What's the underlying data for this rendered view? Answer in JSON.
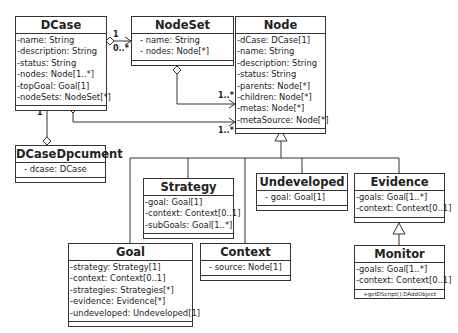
{
  "diagram_type": "UML class diagram",
  "classes": {
    "dcase": {
      "name": "DCase",
      "attributes": [
        "-name: String",
        "-description: String",
        "-status: String",
        "-nodes: Node[1..*]",
        "-topGoal: Goal[1]",
        "-nodeSets: NodeSet[*]"
      ]
    },
    "nodeset": {
      "name": "NodeSet",
      "attributes": [
        "-  name: String",
        "-  nodes: Node[*]"
      ]
    },
    "node": {
      "name": "Node",
      "attributes": [
        "-dCase: DCase[1]",
        "-name: String",
        "-description: String",
        "-status: String",
        "-parents: Node[*]",
        "-children: Node[*]",
        "-metas: Node[*]",
        "-metaSource: Node[*]"
      ]
    },
    "dcasedocument": {
      "name": "DCaseDpcument",
      "attributes": [
        "-  dcase: DCase"
      ]
    },
    "strategy": {
      "name": "Strategy",
      "attributes": [
        "-goal: Goal[1]",
        "-context: Context[0..1]",
        "-subGoals: Goal[1..*]"
      ]
    },
    "undeveloped": {
      "name": "Undeveloped",
      "attributes": [
        "-  goal: Goal[1]"
      ]
    },
    "evidence": {
      "name": "Evidence",
      "attributes": [
        "-goals: Goal[1..*]",
        "-context: Context[0..1]"
      ]
    },
    "goal": {
      "name": "Goal",
      "attributes": [
        "-strategy: Strategy[1]",
        "-context: Context[0..1]",
        "-strategies: Strategies[*]",
        "-evidence: Evidence[*]",
        "-undeveloped: Undeveloped[1]"
      ]
    },
    "context": {
      "name": "Context",
      "attributes": [
        "-  source: Node[1]"
      ]
    },
    "monitor": {
      "name": "Monitor",
      "attributes": [
        "-goals: Goal[1..*]",
        "-context: Context[0..1]"
      ],
      "operations": [
        "+getDScript():DAddObject"
      ]
    }
  },
  "multiplicities": {
    "dcase_nodeset_1": "1",
    "dcase_nodeset_0star": "0..*",
    "nodeset_node": "1..*",
    "dcase_node": "1..*",
    "dcasedoc_dcase": "1"
  },
  "colors": {
    "line": "#333333",
    "background": "#ffffff"
  }
}
